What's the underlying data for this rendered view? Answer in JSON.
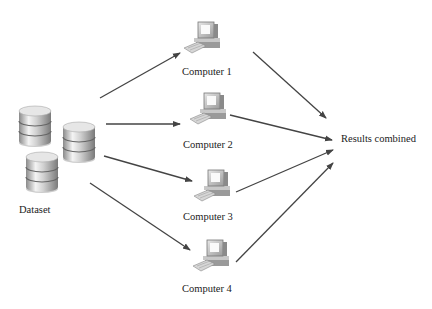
{
  "diagram": {
    "source": {
      "label": "Dataset",
      "icon": "database-icon"
    },
    "computers": [
      {
        "label": "Computer 1",
        "icon": "computer-icon"
      },
      {
        "label": "Computer 2",
        "icon": "computer-icon"
      },
      {
        "label": "Computer 3",
        "icon": "computer-icon"
      },
      {
        "label": "Computer 4",
        "icon": "computer-icon"
      }
    ],
    "sink": {
      "label": "Results combined"
    },
    "edges": [
      {
        "from": "Dataset",
        "to": "Computer 1"
      },
      {
        "from": "Dataset",
        "to": "Computer 2"
      },
      {
        "from": "Dataset",
        "to": "Computer 3"
      },
      {
        "from": "Dataset",
        "to": "Computer 4"
      },
      {
        "from": "Computer 1",
        "to": "Results combined"
      },
      {
        "from": "Computer 2",
        "to": "Results combined"
      },
      {
        "from": "Computer 3",
        "to": "Results combined"
      },
      {
        "from": "Computer 4",
        "to": "Results combined"
      }
    ],
    "colors": {
      "arrow": "#444444",
      "background": "#ffffff"
    }
  }
}
